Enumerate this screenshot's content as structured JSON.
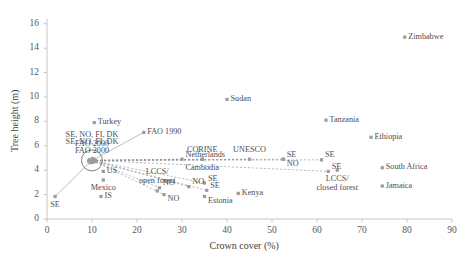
{
  "chart_data": {
    "type": "scatter",
    "title": "",
    "xlabel": "Crown cover (%)",
    "ylabel": "Tree height (m)",
    "xlim": [
      0,
      90
    ],
    "ylim": [
      0,
      16.8
    ],
    "xticks": [
      "0",
      "10",
      "20",
      "30",
      "40",
      "50",
      "60",
      "70",
      "80",
      "90"
    ],
    "yticks": [
      "0",
      "2",
      "4",
      "6",
      "8",
      "10",
      "12",
      "14",
      "16"
    ],
    "grid": false,
    "legend": "none",
    "marker_color": "#9a9a9a",
    "axis_color": "#b9b9b9",
    "text_color": "#4d4d4f",
    "points": [
      {
        "name": "Zimbabwe",
        "x": 79.5,
        "y": 14.9,
        "label": "Zimbabwe",
        "label_pos": "right"
      },
      {
        "name": "Sudan",
        "x": 40.0,
        "y": 9.8,
        "label": "Sudan",
        "label_pos": "right"
      },
      {
        "name": "Tanzania",
        "x": 62.0,
        "y": 8.1,
        "label": "Tanzania",
        "label_pos": "right"
      },
      {
        "name": "Ethiopia",
        "x": 72.0,
        "y": 6.7,
        "label": "Ethiopia",
        "label_pos": "right"
      },
      {
        "name": "Turkey",
        "x": 10.5,
        "y": 7.9,
        "label": "Turkey",
        "label_pos": "right"
      },
      {
        "name": "FAO 1990",
        "x": 21.5,
        "y": 7.1,
        "label": "FAO 1990",
        "label_pos": "right"
      },
      {
        "name": "SE NO FI DK FAO 2000",
        "x": 10.0,
        "y": 4.8,
        "label": "SE, NO, FI, DK\nFAO 2000",
        "label_pos": "above-center"
      },
      {
        "name": "Netherlands",
        "x": 30.0,
        "y": 4.9,
        "label": "Netherlands",
        "label_pos": "above-right"
      },
      {
        "name": "CORINE Cambodia",
        "x": 34.5,
        "y": 4.9,
        "label": "CORINE",
        "label_pos": "above-center"
      },
      {
        "name": "Cambodia",
        "x": 34.5,
        "y": 4.9,
        "label": "Cambodia",
        "label_pos": "below-center"
      },
      {
        "name": "UNESCO",
        "x": 45.0,
        "y": 4.9,
        "label": "UNESCO",
        "label_pos": "above-center"
      },
      {
        "name": "SE NO mid",
        "x": 52.5,
        "y": 4.9,
        "label": "SE",
        "label_pos": "above-right"
      },
      {
        "name": "NO mid",
        "x": 52.5,
        "y": 4.9,
        "label": "NO",
        "label_pos": "below-right"
      },
      {
        "name": "SE right",
        "x": 61.0,
        "y": 4.85,
        "label": "SE",
        "label_pos": "above-right"
      },
      {
        "name": "SE far right",
        "x": 62.5,
        "y": 3.9,
        "label": "SE",
        "label_pos": "above-right"
      },
      {
        "name": "South Africa",
        "x": 74.5,
        "y": 4.2,
        "label": "South Africa",
        "label_pos": "right"
      },
      {
        "name": "Jamaica",
        "x": 74.5,
        "y": 2.7,
        "label": "Jamaica",
        "label_pos": "right"
      },
      {
        "name": "LCCS closed forest",
        "x": 64.5,
        "y": 4.0,
        "label": "LCCS/\nclosed forest",
        "label_pos": "below-center"
      },
      {
        "name": "US",
        "x": 12.5,
        "y": 3.9,
        "label": "US",
        "label_pos": "right"
      },
      {
        "name": "Mexico",
        "x": 12.5,
        "y": 3.2,
        "label": "Mexico",
        "label_pos": "below-center"
      },
      {
        "name": "LCCS open forest",
        "x": 24.5,
        "y": 2.3,
        "label": "LCCS/\nopen forest",
        "label_pos": "above-center"
      },
      {
        "name": "NO lower left",
        "x": 25.0,
        "y": 2.55,
        "label": "NO",
        "label_pos": "above-right"
      },
      {
        "name": "NO lower",
        "x": 26.0,
        "y": 2.0,
        "label": "NO",
        "label_pos": "below-right"
      },
      {
        "name": "NO mid lower",
        "x": 31.5,
        "y": 2.65,
        "label": "NO",
        "label_pos": "above-right"
      },
      {
        "name": "SE upper lower",
        "x": 35.0,
        "y": 2.95,
        "label": "SE",
        "label_pos": "above-right"
      },
      {
        "name": "SE lower",
        "x": 35.5,
        "y": 2.35,
        "label": "SE",
        "label_pos": "above-right"
      },
      {
        "name": "Estonia",
        "x": 35.0,
        "y": 1.85,
        "label": "Estonia",
        "label_pos": "below-right"
      },
      {
        "name": "Kenya",
        "x": 42.5,
        "y": 2.1,
        "label": "Kenya",
        "label_pos": "right"
      },
      {
        "name": "SE bottom left",
        "x": 1.8,
        "y": 1.85,
        "label": "SE",
        "label_pos": "below-center"
      },
      {
        "name": "IS",
        "x": 12.0,
        "y": 1.85,
        "label": "IS",
        "label_pos": "right"
      }
    ],
    "cluster": {
      "name": "nordic-fao-cluster",
      "x": 10.0,
      "y": 4.8,
      "radius_px": 10.5,
      "label": "SE, NO, FI, DK\nFAO 2000"
    },
    "connectors": [
      {
        "from": [
          10.0,
          4.8
        ],
        "to": [
          21.5,
          7.1
        ],
        "style": "solid"
      },
      {
        "from": [
          10.0,
          4.8
        ],
        "to": [
          1.8,
          1.85
        ],
        "style": "solid"
      },
      {
        "from": [
          10.0,
          4.8
        ],
        "to": [
          30.0,
          4.9
        ],
        "style": "dashed"
      },
      {
        "from": [
          10.0,
          4.8
        ],
        "to": [
          34.5,
          4.9
        ],
        "style": "dashed"
      },
      {
        "from": [
          10.0,
          4.8
        ],
        "to": [
          45.0,
          4.9
        ],
        "style": "dashed"
      },
      {
        "from": [
          10.0,
          4.8
        ],
        "to": [
          52.5,
          4.9
        ],
        "style": "dashed"
      },
      {
        "from": [
          10.0,
          4.8
        ],
        "to": [
          61.0,
          4.85
        ],
        "style": "dashed"
      },
      {
        "from": [
          10.0,
          4.8
        ],
        "to": [
          62.5,
          3.9
        ],
        "style": "dashed"
      },
      {
        "from": [
          10.0,
          4.8
        ],
        "to": [
          25.0,
          2.55
        ],
        "style": "dashed"
      },
      {
        "from": [
          10.0,
          4.8
        ],
        "to": [
          26.0,
          2.0
        ],
        "style": "dashed"
      },
      {
        "from": [
          10.0,
          4.8
        ],
        "to": [
          31.5,
          2.65
        ],
        "style": "dashed"
      },
      {
        "from": [
          10.0,
          4.8
        ],
        "to": [
          35.0,
          2.95
        ],
        "style": "dashed"
      },
      {
        "from": [
          10.0,
          4.8
        ],
        "to": [
          35.5,
          2.35
        ],
        "style": "dashed"
      }
    ]
  }
}
